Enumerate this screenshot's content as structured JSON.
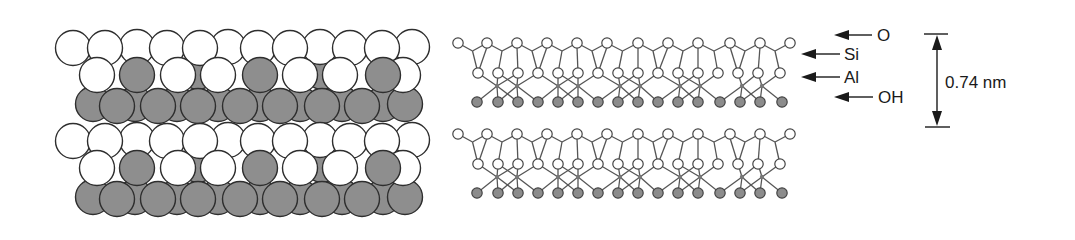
{
  "figure": {
    "space_filling_model": {
      "layer_count": 2,
      "layer_offset_y": 93,
      "colors": {
        "oxygen": "#ffffff",
        "cation": "#8e8e8e",
        "outline": "#2e2e2e"
      }
    },
    "ball_and_stick_model": {
      "layer_count": 2,
      "layer_offset_y": 91,
      "colors": {
        "oxygen": "#ffffff",
        "hydroxyl": "#8c8c8c",
        "aluminum": "#777777",
        "bond": "#555555"
      }
    },
    "labels": [
      {
        "id": "o",
        "text": "O"
      },
      {
        "id": "si",
        "text": "Si"
      },
      {
        "id": "al",
        "text": "Al"
      },
      {
        "id": "oh",
        "text": "OH"
      }
    ],
    "dimension": {
      "text": "0.74 nm"
    }
  }
}
